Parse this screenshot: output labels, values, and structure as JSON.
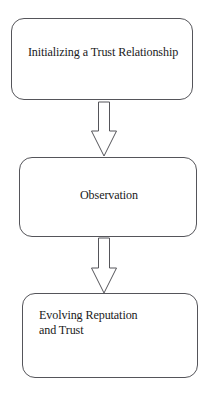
{
  "diagram": {
    "type": "flowchart",
    "orientation": "vertical-top-down",
    "background_color": "#ffffff",
    "stroke_color": "#55555a",
    "text_color": "#1a1a1a",
    "nodes": [
      {
        "id": "initializing",
        "label": "Initializing a Trust Relationship",
        "shape": "rounded-rectangle",
        "text_align": "center"
      },
      {
        "id": "observation",
        "label": "Observation",
        "shape": "rounded-rectangle",
        "text_align": "center"
      },
      {
        "id": "evolving",
        "label": "Evolving Reputation\nand Trust",
        "shape": "rounded-rectangle",
        "text_align": "left"
      }
    ],
    "connectors": [
      {
        "id": "initializing-to-observation",
        "from": "initializing",
        "to": "observation",
        "style": "hollow-block-arrow",
        "direction": "down"
      },
      {
        "id": "observation-to-evolving",
        "from": "observation",
        "to": "evolving",
        "style": "hollow-block-arrow",
        "direction": "down"
      }
    ]
  }
}
